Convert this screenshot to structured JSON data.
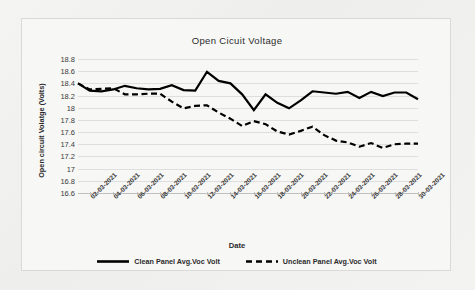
{
  "chart_data": {
    "type": "line",
    "title": "Open Cicuit Voltage",
    "xlabel": "Date",
    "ylabel": "Open circuit Volatge (Volts)",
    "ylim": [
      16.6,
      18.8
    ],
    "ytick_labels": [
      "18.8",
      "18.6",
      "18.4",
      "18.2",
      "18",
      "17.8",
      "17.6",
      "17.4",
      "17.2",
      "17",
      "16.8",
      "16.6"
    ],
    "ytick_values": [
      18.8,
      18.6,
      18.4,
      18.2,
      18,
      17.8,
      17.6,
      17.4,
      17.2,
      17,
      16.8,
      16.6
    ],
    "grid": true,
    "legend_position": "bottom",
    "x": [
      "01-03-2021",
      "02-03-2021",
      "03-03-2021",
      "04-03-2021",
      "05-03-2021",
      "06-03-2021",
      "07-03-2021",
      "08-03-2021",
      "09-03-2021",
      "10-03-2021",
      "11-03-2021",
      "12-03-2021",
      "13-03-2021",
      "14-03-2021",
      "15-03-2021",
      "16-03-2021",
      "17-03-2021",
      "18-03-2021",
      "19-03-2021",
      "20-03-2021",
      "21-03-2021",
      "22-03-2021",
      "23-03-2021",
      "24-03-2021",
      "25-03-2021",
      "26-03-2021",
      "27-03-2021",
      "28-03-2021",
      "29-03-2021",
      "30-03-2021"
    ],
    "xtick_labels": [
      "02-03-2021",
      "04-03-2021",
      "06-03-2021",
      "08-03-2021",
      "10-03-2021",
      "12-03-2021",
      "14-03-2021",
      "16-03-2021",
      "18-03-2021",
      "20-03-2021",
      "22-03-2021",
      "24-03-2021",
      "26-03-2021",
      "28-03-2021",
      "30-03-2021"
    ],
    "series": [
      {
        "name": "Clean Panel Avg.Voc Volt",
        "style": "solid",
        "color": "#000000",
        "values": [
          18.4,
          18.28,
          18.27,
          18.3,
          18.36,
          18.32,
          18.3,
          18.31,
          18.37,
          18.29,
          18.28,
          18.59,
          18.44,
          18.4,
          18.22,
          17.96,
          18.22,
          18.08,
          17.99,
          18.12,
          18.27,
          18.25,
          18.23,
          18.26,
          18.16,
          18.26,
          18.19,
          18.25,
          18.25,
          18.14
        ]
      },
      {
        "name": "Unclean Panel Avg.Voc Volt",
        "style": "dashed",
        "color": "#000000",
        "values": [
          18.4,
          18.3,
          18.31,
          18.32,
          18.22,
          18.22,
          18.23,
          18.23,
          18.1,
          17.99,
          18.03,
          18.04,
          17.92,
          17.82,
          17.7,
          17.78,
          17.73,
          17.61,
          17.56,
          17.62,
          17.69,
          17.55,
          17.46,
          17.43,
          17.36,
          17.42,
          17.34,
          17.4,
          17.41,
          17.41
        ]
      }
    ]
  },
  "legend": {
    "items": [
      {
        "label": "Clean Panel Avg.Voc Volt",
        "style": "solid"
      },
      {
        "label": "Unclean Panel Avg.Voc Volt",
        "style": "dashed"
      }
    ]
  }
}
